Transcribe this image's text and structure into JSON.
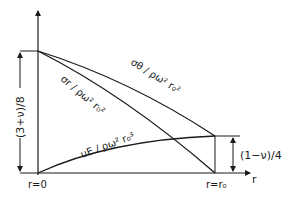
{
  "diagram": {
    "axis": {
      "horizontal_label": "r",
      "origin_label": "r=0",
      "outer_label": "r=r₀"
    },
    "curves": {
      "sigma_theta": {
        "label": "σθ / ρω² r₀²"
      },
      "sigma_r": {
        "label": "σr / ρω² r₀²"
      },
      "displacement": {
        "label": "uE / ρω² r₀³"
      }
    },
    "dimensions": {
      "left": "(3+ν)/8",
      "right": "(1−ν)/4"
    },
    "colors": {
      "ink": "#1a1a1a",
      "background": "#ffffff"
    }
  }
}
